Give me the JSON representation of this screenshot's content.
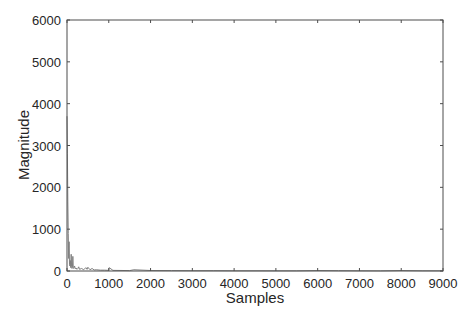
{
  "chart_data": {
    "type": "line",
    "title": "",
    "xlabel": "Samples",
    "ylabel": "Magnitude",
    "xlim": [
      0,
      9000
    ],
    "ylim": [
      0,
      6000
    ],
    "grid": false,
    "legend": null,
    "xticks": [
      0,
      1000,
      2000,
      3000,
      4000,
      5000,
      6000,
      7000,
      8000,
      9000
    ],
    "yticks": [
      0,
      1000,
      2000,
      3000,
      4000,
      5000,
      6000
    ],
    "series": [
      {
        "name": "magnitude",
        "color": "#7f7f7f",
        "x": [
          0,
          10,
          20,
          30,
          40,
          50,
          60,
          70,
          80,
          90,
          100,
          110,
          120,
          130,
          140,
          150,
          160,
          180,
          200,
          220,
          240,
          260,
          280,
          300,
          350,
          400,
          450,
          480,
          500,
          550,
          600,
          650,
          700,
          800,
          900,
          1000,
          1010,
          1100,
          1500,
          1600,
          2000,
          2500,
          3000,
          3500,
          4000,
          4500,
          5000,
          5500,
          6000,
          6500,
          7000,
          7500,
          8000,
          8500,
          9000
        ],
        "y": [
          3700,
          2800,
          1650,
          900,
          300,
          700,
          150,
          120,
          250,
          80,
          400,
          100,
          60,
          90,
          350,
          80,
          60,
          120,
          50,
          70,
          40,
          60,
          100,
          40,
          60,
          30,
          80,
          40,
          90,
          30,
          60,
          25,
          30,
          20,
          20,
          15,
          80,
          15,
          10,
          30,
          12,
          10,
          8,
          8,
          6,
          6,
          5,
          5,
          12,
          8,
          6,
          4,
          12,
          6,
          5
        ]
      }
    ]
  }
}
